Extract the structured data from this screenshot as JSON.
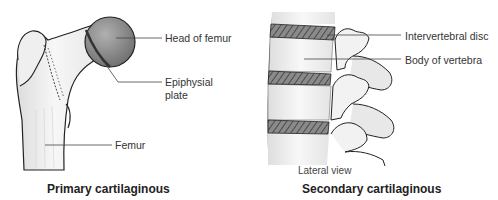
{
  "figures": [
    {
      "id": "primary",
      "caption": "Primary cartilaginous",
      "labels": {
        "head": "Head of femur",
        "plate_line1": "Epiphysial",
        "plate_line2": "plate",
        "bone": "Femur"
      }
    },
    {
      "id": "secondary",
      "caption": "Secondary cartilaginous",
      "view": "Lateral view",
      "labels": {
        "disc": "Intervertebral disc",
        "body": "Body of vertebra"
      }
    }
  ],
  "colors": {
    "bone": "#f4f4f4",
    "outline": "#222222",
    "head_shade": "#8c8c8c",
    "disc_hatch": "#6a6a6a",
    "leader": "#444444"
  }
}
